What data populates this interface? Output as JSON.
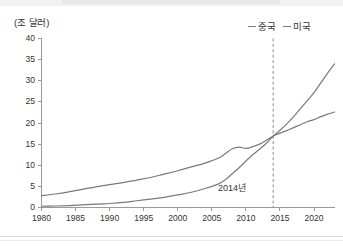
{
  "axis_unit_label": "(조 달러)",
  "annotation_2014": "2014년",
  "legend": {
    "items": [
      {
        "label": "중국",
        "color": "#7a7a7a"
      },
      {
        "label": "미국",
        "color": "#7a7a7a"
      }
    ]
  },
  "chart_data": {
    "type": "line",
    "title": "",
    "subtitle": "",
    "xlabel": "",
    "ylabel": "(조 달러)",
    "xlim": [
      1980,
      2023
    ],
    "ylim": [
      0,
      40
    ],
    "grid": false,
    "legend_position": "top-right",
    "xticks": [
      "1980",
      "1985",
      "1990",
      "1995",
      "2000",
      "2005",
      "2010",
      "2015",
      "2020"
    ],
    "xtick_values": [
      1980,
      1985,
      1990,
      1995,
      2000,
      2005,
      2010,
      2015,
      2020
    ],
    "yticks": [
      "0",
      "5",
      "10",
      "15",
      "20",
      "25",
      "30",
      "35",
      "40"
    ],
    "ytick_values": [
      0,
      5,
      10,
      15,
      20,
      25,
      30,
      35,
      40
    ],
    "x": [
      1980,
      1982,
      1984,
      1986,
      1988,
      1990,
      1992,
      1994,
      1996,
      1998,
      2000,
      2002,
      2004,
      2006,
      2007,
      2008,
      2009,
      2010,
      2011,
      2012,
      2013,
      2014,
      2015,
      2016,
      2017,
      2018,
      2019,
      2020,
      2021,
      2022,
      2023
    ],
    "series": [
      {
        "name": "중국",
        "color": "#7a7a7a",
        "values": [
          0.3,
          0.35,
          0.45,
          0.6,
          0.8,
          0.95,
          1.2,
          1.6,
          2.0,
          2.4,
          3.0,
          3.6,
          4.5,
          5.6,
          6.6,
          8.0,
          9.4,
          11.0,
          12.5,
          13.8,
          15.2,
          16.9,
          18.3,
          19.8,
          21.5,
          23.4,
          25.3,
          27.2,
          29.5,
          31.8,
          34.0
        ]
      },
      {
        "name": "미국",
        "color": "#7a7a7a",
        "values": [
          2.8,
          3.2,
          3.7,
          4.3,
          4.9,
          5.4,
          5.9,
          6.5,
          7.1,
          7.9,
          8.7,
          9.6,
          10.5,
          11.7,
          12.8,
          13.9,
          14.3,
          14.0,
          14.4,
          15.0,
          15.9,
          16.9,
          17.6,
          18.2,
          18.9,
          19.6,
          20.3,
          20.8,
          21.5,
          22.1,
          22.6
        ]
      }
    ],
    "annotations": [
      {
        "text": "2014년",
        "x": 2014,
        "type": "vertical-dashed-line",
        "crossing_value": 17
      }
    ]
  }
}
